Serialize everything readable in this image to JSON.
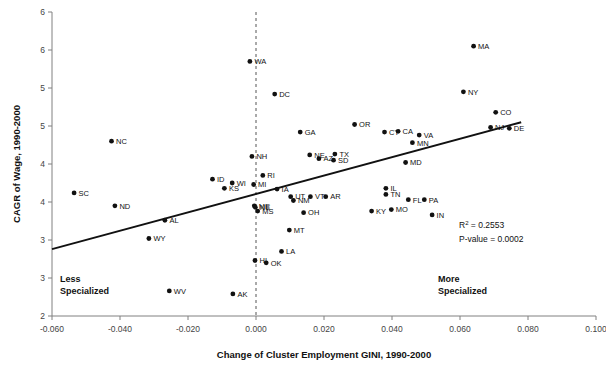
{
  "chart_data": {
    "type": "scatter",
    "title": "",
    "xlabel": "Change of Cluster Employment GINI, 1990-2000",
    "ylabel": "CAGR of Wage, 1990-2000",
    "xlim": [
      -0.06,
      0.1
    ],
    "ylim": [
      2.5,
      6.5
    ],
    "grid": false,
    "legend_position": "none",
    "xticks": [
      "-0.060",
      "-0.040",
      "-0.020",
      "0.000",
      "0.020",
      "0.040",
      "0.060",
      "0.080",
      "0.100"
    ],
    "xtick_values": [
      -0.06,
      -0.04,
      -0.02,
      0.0,
      0.02,
      0.04,
      0.06,
      0.08,
      0.1
    ],
    "yticks": [
      "6",
      "6",
      "5",
      "5",
      "4",
      "4",
      "3",
      "3",
      "2"
    ],
    "ytick_values": [
      6.5,
      6.0,
      5.5,
      5.0,
      4.5,
      4.0,
      3.5,
      3.0,
      2.5
    ],
    "points": [
      {
        "label": "SC",
        "x": -0.0535,
        "y": 4.12
      },
      {
        "label": "NC",
        "x": -0.0425,
        "y": 4.8
      },
      {
        "label": "ND",
        "x": -0.0415,
        "y": 3.95
      },
      {
        "label": "WY",
        "x": -0.0315,
        "y": 3.52
      },
      {
        "label": "AL",
        "x": -0.0268,
        "y": 3.76
      },
      {
        "label": "WV",
        "x": -0.0255,
        "y": 2.83
      },
      {
        "label": "ID",
        "x": -0.0128,
        "y": 4.3
      },
      {
        "label": "KS",
        "x": -0.0093,
        "y": 4.18
      },
      {
        "label": "WI",
        "x": -0.007,
        "y": 4.25
      },
      {
        "label": "AK",
        "x": -0.0068,
        "y": 2.79
      },
      {
        "label": "WA",
        "x": -0.0018,
        "y": 5.85
      },
      {
        "label": "NH",
        "x": -0.0012,
        "y": 4.6
      },
      {
        "label": "MI",
        "x": -0.0007,
        "y": 4.23
      },
      {
        "label": "HI",
        "x": -0.0003,
        "y": 3.23
      },
      {
        "label": "ME",
        "x": -0.0005,
        "y": 3.95
      },
      {
        "label": "NE",
        "x": -0.0002,
        "y": 3.93
      },
      {
        "label": "MS",
        "x": 0.0005,
        "y": 3.88
      },
      {
        "label": "RI",
        "x": 0.002,
        "y": 4.35
      },
      {
        "label": "OK",
        "x": 0.003,
        "y": 3.2
      },
      {
        "label": "DC",
        "x": 0.0055,
        "y": 5.42
      },
      {
        "label": "IA",
        "x": 0.0062,
        "y": 4.17
      },
      {
        "label": "LA",
        "x": 0.0075,
        "y": 3.35
      },
      {
        "label": "MT",
        "x": 0.0098,
        "y": 3.63
      },
      {
        "label": "UT",
        "x": 0.0102,
        "y": 4.07
      },
      {
        "label": "NM",
        "x": 0.011,
        "y": 4.02
      },
      {
        "label": "GA",
        "x": 0.013,
        "y": 4.92
      },
      {
        "label": "OH",
        "x": 0.014,
        "y": 3.86
      },
      {
        "label": "NE",
        "x": 0.0158,
        "y": 4.62
      },
      {
        "label": "VT",
        "x": 0.016,
        "y": 4.07
      },
      {
        "label": "AZ",
        "x": 0.0185,
        "y": 4.57
      },
      {
        "label": "AR",
        "x": 0.0205,
        "y": 4.07
      },
      {
        "label": "SD",
        "x": 0.0228,
        "y": 4.55
      },
      {
        "label": "TX",
        "x": 0.0232,
        "y": 4.63
      },
      {
        "label": "OR",
        "x": 0.029,
        "y": 5.02
      },
      {
        "label": "KY",
        "x": 0.034,
        "y": 3.88
      },
      {
        "label": "CT",
        "x": 0.0378,
        "y": 4.92
      },
      {
        "label": "IL",
        "x": 0.0382,
        "y": 4.18
      },
      {
        "label": "TN",
        "x": 0.0382,
        "y": 4.1
      },
      {
        "label": "MO",
        "x": 0.0398,
        "y": 3.9
      },
      {
        "label": "CA",
        "x": 0.0418,
        "y": 4.93
      },
      {
        "label": "MD",
        "x": 0.044,
        "y": 4.52
      },
      {
        "label": "FL",
        "x": 0.0448,
        "y": 4.03
      },
      {
        "label": "MN",
        "x": 0.046,
        "y": 4.78
      },
      {
        "label": "VA",
        "x": 0.048,
        "y": 4.88
      },
      {
        "label": "PA",
        "x": 0.0495,
        "y": 4.03
      },
      {
        "label": "IN",
        "x": 0.0518,
        "y": 3.83
      },
      {
        "label": "MA",
        "x": 0.064,
        "y": 6.05
      },
      {
        "label": "NY",
        "x": 0.061,
        "y": 5.45
      },
      {
        "label": "NJ",
        "x": 0.069,
        "y": 4.98
      },
      {
        "label": "CO",
        "x": 0.0705,
        "y": 5.18
      },
      {
        "label": "DE",
        "x": 0.0745,
        "y": 4.97
      }
    ],
    "trendline": {
      "x1": -0.06,
      "y1": 3.38,
      "x2": 0.078,
      "y2": 5.05
    },
    "reference_line": {
      "x": 0.0,
      "style": "dashed"
    },
    "annotations": [
      {
        "name": "less-specialized",
        "line1": "Less",
        "line2": "Specialized"
      },
      {
        "name": "more-specialized",
        "line1": "More",
        "line2": "Specialized"
      }
    ],
    "stats": {
      "r_squared_label": "R",
      "r_squared_sup": "2",
      "r_squared_value": " = 0.2553",
      "p_value": "P-value = 0.0002"
    }
  }
}
